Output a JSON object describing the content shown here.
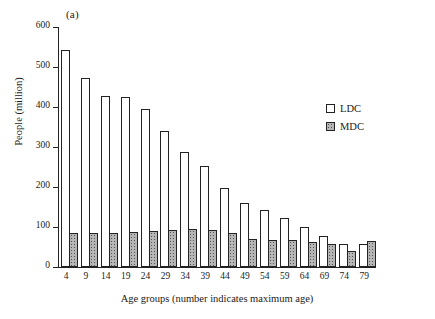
{
  "panel": {
    "label": "(a)"
  },
  "legend": {
    "position": "upper-right",
    "entries": [
      {
        "key": "LDC",
        "label": "LDC",
        "swatch": "open-square-icon",
        "color": "#ffffff"
      },
      {
        "key": "MDC",
        "label": "MDC",
        "swatch": "stippled-square-icon",
        "color": "#b6b6b6"
      }
    ]
  },
  "axes": {
    "y": {
      "title": "People (million)",
      "ticks": [
        0,
        100,
        200,
        300,
        400,
        500,
        600
      ],
      "min": 0,
      "max": 600
    },
    "x": {
      "title": "Age groups (number indicates maximum age)",
      "ticks": [
        "4",
        "9",
        "14",
        "19",
        "24",
        "29",
        "34",
        "39",
        "44",
        "49",
        "54",
        "59",
        "64",
        "69",
        "74",
        "79"
      ]
    }
  },
  "chart_data": {
    "type": "bar",
    "title": "(a)",
    "xlabel": "Age groups (number indicates maximum age)",
    "ylabel": "People (million)",
    "ylim": [
      0,
      600
    ],
    "yticks": [
      0,
      100,
      200,
      300,
      400,
      500,
      600
    ],
    "grid": false,
    "legend_position": "upper right",
    "categories": [
      "4",
      "9",
      "14",
      "19",
      "24",
      "29",
      "34",
      "39",
      "44",
      "49",
      "54",
      "59",
      "64",
      "69",
      "74",
      "79"
    ],
    "series": [
      {
        "name": "LDC",
        "fill": "white",
        "values": [
          543,
          473,
          427,
          425,
          395,
          341,
          287,
          252,
          197,
          161,
          143,
          122,
          101,
          77,
          58,
          58
        ]
      },
      {
        "name": "MDC",
        "fill": "stippled-gray",
        "values": [
          86,
          86,
          85,
          88,
          91,
          92,
          95,
          93,
          86,
          69,
          68,
          67,
          63,
          57,
          40,
          65
        ]
      }
    ]
  }
}
